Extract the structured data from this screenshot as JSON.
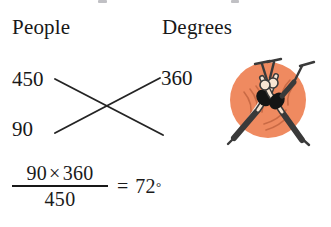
{
  "page": {
    "background_color": "#ffffff",
    "text_color": "#181818"
  },
  "columns": {
    "left_header": "People",
    "right_header": "Degrees"
  },
  "proportion": {
    "people_top": "450",
    "degrees_top": "360",
    "people_bottom": "90",
    "cross_lines_label": "cross-multiplication-x"
  },
  "equation": {
    "numerator_left": "90",
    "times": "×",
    "numerator_right": "360",
    "denominator": "450",
    "equals": "=",
    "result": "72",
    "degree_symbol": "°",
    "full_text": "90 × 360 / 450 = 72°"
  },
  "illustration": {
    "name": "crossed-gymnasts-emblem",
    "circle_color": "#ef8a60",
    "figure_outline_color": "#3a3a3a",
    "figure_leotard_color": "#1a1a1a",
    "figure_skin_color": "#f7e4d2",
    "figure_count": 2
  },
  "crop_remnants": {
    "note": "partial descenders of a line cropped above the top edge"
  }
}
